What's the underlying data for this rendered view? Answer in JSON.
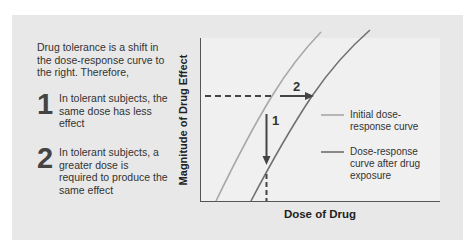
{
  "description": {
    "intro": "Drug tolerance is a shift in the dose-response curve to the right. Therefore,",
    "points": [
      {
        "number": "1",
        "text": "In tolerant subjects, the same dose has less effect"
      },
      {
        "number": "2",
        "text": "In tolerant subjects, a greater dose is required to produce the same effect"
      }
    ]
  },
  "graph": {
    "y_axis_label": "Magnitude of Drug Effect",
    "x_axis_label": "Dose of Drug",
    "annotations": {
      "arrow_1": "1",
      "arrow_2": "2"
    },
    "legend": [
      {
        "label": "Initial dose-response curve",
        "color": "#a8a8a8"
      },
      {
        "label": "Dose-response curve after drug exposure",
        "color": "#707070"
      }
    ]
  },
  "colors": {
    "background": "#e8e8e8",
    "panel": "#f0f0f0",
    "initial_curve": "#a8a8a8",
    "shifted_curve": "#707070",
    "arrows": "#444444"
  }
}
